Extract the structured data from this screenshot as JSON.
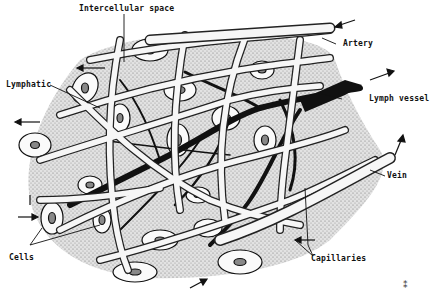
{
  "figure": {
    "labels": {
      "intercellular_space": "Intercellular space",
      "artery": "Artery",
      "lymphatic": "Lymphatic",
      "lymph_vessel": "Lymph vessel",
      "vein": "Vein",
      "cells": "Cells",
      "capillaries": "Capillaries"
    },
    "colors": {
      "ink": "#111111",
      "tissue_stipple": "#9a9a9a",
      "tissue_fill": "#d6d6d6",
      "vessel_fill": "#f4f4f4",
      "lymph_fill": "#111111",
      "background": "#ffffff"
    }
  }
}
